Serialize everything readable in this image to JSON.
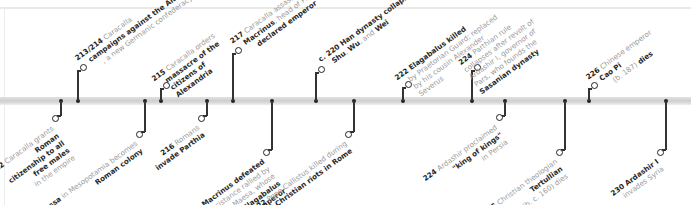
{
  "timeline": {
    "bar_y": 101,
    "colors": {
      "line": "#333333",
      "text_muted": "#9a9a9a",
      "text_strong": "#1d1d1d",
      "bar": "#d4d4d4"
    },
    "events_above": [
      {
        "x": 78,
        "ring_x": 84,
        "ring_y": 66,
        "year": "213/214",
        "lines": [
          [
            "Caracalla",
            ""
          ],
          [
            "",
            "campaigns against the"
          ],
          [
            "",
            "Alamanni"
          ],
          [
            ", a new",
            ""
          ],
          [
            "Germanic confederacy",
            ""
          ]
        ]
      },
      {
        "x": 161,
        "ring_x": 167,
        "ring_y": 84,
        "year": "215",
        "text": "Caracalla orders",
        "strong": "massacre of the citizens of Alexandria"
      },
      {
        "x": 233,
        "ring_x": 239,
        "ring_y": 49,
        "year": "217",
        "text": "Caracalla assassinated near Edessa;",
        "strong": "Macrinus",
        "text2": ", head of Praetorian Guard,",
        "strong2": "declared emperor"
      },
      {
        "x": 316,
        "ring_x": 322,
        "ring_y": 68,
        "year": "c. 220",
        "strong": "Han dynasty collapses",
        "text": ", replaced by kingdoms of",
        "strong2": "Shu, Wu,",
        "text2": " and ",
        "strong3": "Wei"
      },
      {
        "x": 403,
        "ring_x": 409,
        "ring_y": 83,
        "year": "222",
        "strong": "Elagabalus killed",
        "text": " by Praetorian Guard; replaced by his cousin Alexander Severus"
      },
      {
        "x": 472,
        "ring_x": 478,
        "ring_y": 66,
        "year": "224",
        "text": "Parthian rule collapses after revolt of Ardashir I, governor of Pars, who founds the",
        "strong": "Sasanian dynasty"
      },
      {
        "x": 589,
        "ring_x": 595,
        "ring_y": 84,
        "year": "226",
        "text": "Chinese emperor",
        "strong": "Cao Pi",
        "text2": " (b. 187)",
        "strong2": "dies"
      }
    ],
    "events_below": [
      {
        "x": 61,
        "ring_x": 55,
        "ring_y": 119,
        "year": "212",
        "text": "Caracalla grants",
        "strong": "Roman citizenship to all free males",
        "text2": "in the empire"
      },
      {
        "x": 145,
        "ring_x": 139,
        "ring_y": 135,
        "year": "214",
        "strong": "Edessa",
        "text": " in Mesopotamia becomes",
        "strong2": "Roman colony"
      },
      {
        "x": 207,
        "ring_x": 201,
        "ring_y": 119,
        "year": "216",
        "text": "Romans",
        "strong": "invade Parthia"
      },
      {
        "x": 272,
        "ring_x": 266,
        "ring_y": 153,
        "year": "218",
        "strong": "Macrinus defeated",
        "text": " after resistance rallied by Julia Maesa, whose grandson",
        "strong2": "Elagabalus becomes emperor"
      },
      {
        "x": 354,
        "ring_x": 348,
        "ring_y": 135,
        "year": "222",
        "text": "Pope Callistus killed during",
        "strong": "anti-Christian riots in Rome"
      },
      {
        "x": 505,
        "ring_x": 499,
        "ring_y": 118,
        "year": "224",
        "text": "Ardashir proclaimed",
        "strong": "\"king of kings\"",
        "text2": " in Persia"
      },
      {
        "x": 565,
        "ring_x": 559,
        "ring_y": 153,
        "year": "225",
        "text": "Christian theologian",
        "strong": "Tertullian",
        "text2": " (b. c. 160) dies"
      },
      {
        "x": 666,
        "ring_x": 660,
        "ring_y": 153,
        "year": "230",
        "strong": "Ardashir I",
        "text": " invades Syria"
      }
    ]
  },
  "labels": {
    "e213": {
      "year": "213/214",
      "t1": "Caracalla",
      "s1": "campaigns against the Alamanni",
      "t2": ", a new Germanic confederacy"
    },
    "e215": {
      "year": "215",
      "t1": "Caracalla orders",
      "s1": "massacre of the citizens of Alexandria"
    },
    "e217": {
      "year": "217",
      "t1": "Caracalla assassinated near Edessa;",
      "s1": "Macrinus",
      "t2": ", head of Praetorian Guard,",
      "s2": "declared emperor"
    },
    "e220": {
      "year": "c. 220",
      "s1": "Han dynasty collapses",
      "t1": ", replaced by kingdoms of",
      "s2": "Shu",
      "t2": ",",
      "s3": "Wu",
      "t3": ", and",
      "s4": "Wei"
    },
    "e222a": {
      "year": "222",
      "s1": "Elagabalus killed",
      "t1": "by Praetorian Guard; replaced by his cousin Alexander Severus"
    },
    "e224a": {
      "year": "224",
      "t1": "Parthian rule collapses after revolt of Ardashir I, governor of Pars, who founds the",
      "s1": "Sasanian dynasty"
    },
    "e226": {
      "year": "226",
      "t1": "Chinese emperor",
      "s1": "Cao Pi",
      "t2": "(b. 187)",
      "s2": "dies"
    },
    "e212": {
      "year": "212",
      "t1": "Caracalla grants",
      "s1": "Roman citizenship to all free males",
      "t2": "in the empire"
    },
    "e214": {
      "year": "214",
      "s1": "Edessa",
      "t1": "in Mesopotamia becomes",
      "s2": "Roman colony"
    },
    "e216": {
      "year": "216",
      "t1": "Romans",
      "s1": "invade Parthia"
    },
    "e218": {
      "year": "218",
      "s1": "Macrinus defeated",
      "t1": "after resistance rallied by Julia Maesa, whose grandson",
      "s2": "Elagabalus becomes emperor"
    },
    "e222b": {
      "year": "222",
      "t1": "Pope Callistus killed during",
      "s1": "anti-Christian riots in Rome"
    },
    "e224b": {
      "year": "224",
      "t1": "Ardashir proclaimed",
      "s1": "\"king of kings\"",
      "t2": "in Persia"
    },
    "e225": {
      "year": "225",
      "t1": "Christian theologian",
      "s1": "Tertullian",
      "t2": "(b. c. 160) dies"
    },
    "e230": {
      "year": "230",
      "s1": "Ardashir I",
      "t1": "invades Syria"
    }
  }
}
